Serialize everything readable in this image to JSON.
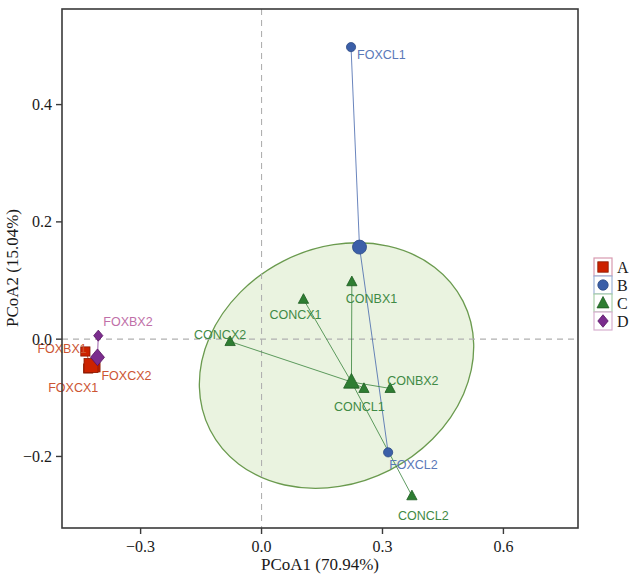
{
  "figure": {
    "type": "pcoa-ordination-scatter",
    "width": 635,
    "height": 578,
    "background": "#ffffff"
  },
  "chart_data": {
    "type": "scatter",
    "title": "",
    "xlabel": "PCoA1 (70.94%)",
    "ylabel": "PCoA2 (15.04%)",
    "xlim": [
      -0.495,
      0.785
    ],
    "ylim": [
      -0.322,
      0.563
    ],
    "xticks": [
      -0.3,
      0.0,
      0.3,
      0.6
    ],
    "xtick_labels": [
      "−0.3",
      "0.0",
      "0.3",
      "0.6"
    ],
    "yticks": [
      0.4,
      0.2,
      0.0,
      -0.2
    ],
    "ytick_labels": [
      "0.4",
      "0.2",
      "0.0",
      "−0.2"
    ],
    "grid": false,
    "reference_lines": {
      "vertical_x": 0.0,
      "horizontal_y": 0.0,
      "style": "dashed",
      "color": "#b0b0b0"
    },
    "legend": {
      "position": "right-outside",
      "entries": [
        {
          "label": "A",
          "marker": "square",
          "color": "#cc2200",
          "box_border": "#d89ab0"
        },
        {
          "label": "B",
          "marker": "circle",
          "color": "#3b5fa8",
          "box_border": "#9fb4d8"
        },
        {
          "label": "C",
          "marker": "triangle",
          "color": "#2e7d32",
          "box_border": "#a9cfa9"
        },
        {
          "label": "D",
          "marker": "diamond",
          "color": "#7b2d8e",
          "box_border": "#d8b0cf"
        }
      ]
    },
    "groups": [
      {
        "name": "A",
        "marker": "square",
        "color": "#cc2200",
        "label_color": "#cc5533",
        "centroid": {
          "x": -0.423,
          "y": -0.045
        },
        "points": [
          {
            "name": "FOXBX1",
            "x": -0.437,
            "y": -0.021,
            "label_dx": -48,
            "label_dy": 2
          },
          {
            "name": "FOXCX1",
            "x": -0.43,
            "y": -0.05,
            "label_dx": -40,
            "label_dy": 24
          },
          {
            "name": "FOXCX2",
            "x": -0.412,
            "y": -0.048,
            "label_dx": 6,
            "label_dy": 13
          }
        ]
      },
      {
        "name": "B",
        "marker": "circle",
        "color": "#3b5fa8",
        "label_color": "#5a79b8",
        "centroid": {
          "x": 0.243,
          "y": 0.157
        },
        "points": [
          {
            "name": "FOXCL1",
            "x": 0.222,
            "y": 0.498,
            "label_dx": 6,
            "label_dy": 12
          },
          {
            "name": "FOXCL2",
            "x": 0.314,
            "y": -0.193,
            "label_dx": 1,
            "label_dy": 17
          }
        ]
      },
      {
        "name": "C",
        "marker": "triangle",
        "color": "#2e7d32",
        "label_color": "#3f8a45",
        "centroid": {
          "x": 0.223,
          "y": -0.073
        },
        "points": [
          {
            "name": "CONCX1",
            "x": 0.104,
            "y": 0.068,
            "label_dx": -34,
            "label_dy": 20
          },
          {
            "name": "CONCX2",
            "x": -0.078,
            "y": -0.004,
            "label_dx": -36,
            "label_dy": -3
          },
          {
            "name": "CONBX1",
            "x": 0.224,
            "y": 0.098,
            "label_dx": -6,
            "label_dy": 21
          },
          {
            "name": "CONBX2",
            "x": 0.319,
            "y": -0.084,
            "label_dx": -3,
            "label_dy": -3
          },
          {
            "name": "CONCL1",
            "x": 0.254,
            "y": -0.084,
            "label_dx": -30,
            "label_dy": 23
          },
          {
            "name": "CONCL2",
            "x": 0.373,
            "y": -0.267,
            "label_dx": -14,
            "label_dy": 24
          }
        ]
      },
      {
        "name": "D",
        "marker": "diamond",
        "color": "#7b2d8e",
        "label_color": "#c06fa8",
        "centroid": {
          "x": -0.407,
          "y": -0.031
        },
        "points": [
          {
            "name": "FOXBX2",
            "x": -0.405,
            "y": 0.006,
            "label_dx": 5,
            "label_dy": -10
          }
        ]
      }
    ],
    "confidence_ellipse": {
      "group": "C",
      "center_x": 0.186,
      "center_y": -0.045,
      "rx": 0.352,
      "ry": 0.2,
      "rotation_deg": -27,
      "fill": "#eaf3e0",
      "stroke": "#6a9a4e"
    }
  },
  "legend_entries": [
    {
      "label": "A"
    },
    {
      "label": "B"
    },
    {
      "label": "C"
    },
    {
      "label": "D"
    }
  ]
}
